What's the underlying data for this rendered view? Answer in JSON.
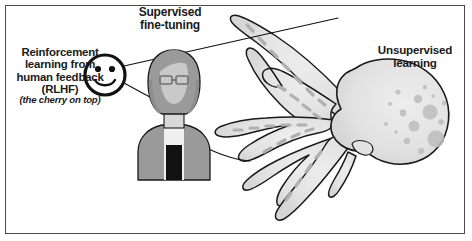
{
  "figure": {
    "name": "llm-training-stages-octopus-diagram",
    "width": 472,
    "height": 241,
    "background": "#ffffff",
    "frame_color": "#4c4c4c"
  },
  "labels": {
    "rlhf": {
      "text": "Reinforcement\nlearning from\nhuman feedback\n(RLHF)",
      "sub_text": "(the cherry on top)",
      "points_to": "smiley-face-icon"
    },
    "supervised_fine_tuning": {
      "text": "Supervised\nfine-tuning",
      "points_to": "person-figure"
    },
    "unsupervised_learning": {
      "text": "Unsupervised\nlearning",
      "points_to": "octopus-figure"
    }
  },
  "colors": {
    "outline": "#1a1a1a",
    "frame": "#4c4c4c",
    "octopus_body": "#e4e4e4",
    "octopus_spot": "#bdbdbd",
    "octopus_sucker": "#b0b0b0",
    "person_body": "#9a9a9a",
    "person_hair": "#9a9a9a",
    "person_face": "#c9c9c9",
    "person_shirt": "#efefef",
    "person_tie": "#111111",
    "smiley_fill": "#ffffff",
    "leader_line": "#111111",
    "text": "#1a1a1a"
  },
  "elements": {
    "smiley": "smiley-face-icon",
    "person": "person-with-glasses-figure",
    "octopus": "octopus-figure",
    "leader_lines": 3
  }
}
